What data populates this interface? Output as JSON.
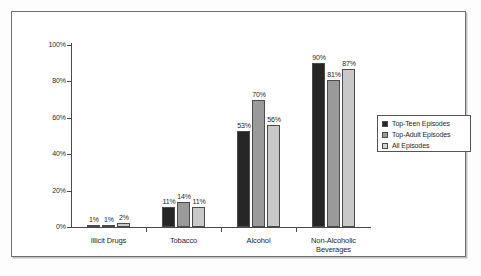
{
  "chart_data": {
    "type": "bar",
    "title": "",
    "xlabel": "",
    "ylabel": "",
    "ylim": [
      0,
      100
    ],
    "grid": false,
    "legend_position": "right",
    "categories": [
      "Illicit Drugs",
      "Tobacco",
      "Alcohol",
      "Non-Alcoholic Beverages"
    ],
    "category_lines": [
      [
        "Illicit Drugs"
      ],
      [
        "Tobacco"
      ],
      [
        "Alcohol"
      ],
      [
        "Non-Alcoholic",
        "Beverages"
      ]
    ],
    "series": [
      {
        "name": "Top-Teen Episodes",
        "color": "#262626",
        "values": [
          1,
          11,
          53,
          90
        ],
        "labels": [
          "1%",
          "11%",
          "53%",
          "90%"
        ]
      },
      {
        "name": "Top-Adult Episodes",
        "color": "#9a9a9a",
        "values": [
          1,
          14,
          70,
          81
        ],
        "labels": [
          "1%",
          "14%",
          "70%",
          "81%"
        ]
      },
      {
        "name": "All Episodes",
        "color": "#c8c8c8",
        "values": [
          2,
          11,
          56,
          87
        ],
        "labels": [
          "2%",
          "11%",
          "56%",
          "87%"
        ]
      }
    ],
    "y_ticks": [
      0,
      20,
      40,
      60,
      80,
      100
    ],
    "y_tick_labels": [
      "0%",
      "20%",
      "40%",
      "60%",
      "80%",
      "100%"
    ]
  },
  "legend": {
    "items": [
      {
        "label": "Top-Teen Episodes"
      },
      {
        "label": "Top-Adult Episodes"
      },
      {
        "label": "All Episodes"
      }
    ]
  }
}
